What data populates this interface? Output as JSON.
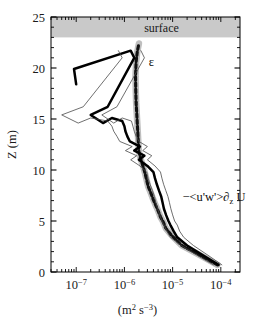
{
  "chart_data": {
    "type": "line",
    "title": "",
    "xlabel": "(m² s⁻³)",
    "ylabel": "Z (m)",
    "xscale": "log",
    "yscale": "linear",
    "xlim": [
      3e-08,
      0.00025
    ],
    "ylim": [
      0,
      25
    ],
    "grid": false,
    "legend_position": "inline-annotations",
    "xticks": [
      1e-07,
      1e-06,
      1e-05,
      0.0001
    ],
    "xtick_labels": [
      "10⁻⁷",
      "10⁻⁶",
      "10⁻⁵",
      "10⁻⁴"
    ],
    "yticks": [
      0,
      5,
      10,
      15,
      20,
      25
    ],
    "ytick_labels": [
      "0",
      "5",
      "10",
      "15",
      "20",
      "25"
    ],
    "yminor_ticks": [
      1,
      2,
      3,
      4,
      6,
      7,
      8,
      9,
      11,
      12,
      13,
      14,
      16,
      17,
      18,
      19,
      21,
      22,
      23,
      24
    ],
    "shaded_regions": [
      {
        "name": "surface",
        "label": "surface",
        "y_from": 23.0,
        "y_to": 25.0,
        "color": "#c9c9c9"
      }
    ],
    "annotations": [
      {
        "name": "epsilon-label",
        "text": "ε",
        "x": 3.2e-06,
        "y": 20.2
      },
      {
        "name": "stress-production-label",
        "text": "−<u'w'>∂",
        "sub": "z",
        "text_tail": " U",
        "x": 1.6e-05,
        "y": 7.0
      }
    ],
    "series": [
      {
        "name": "epsilon",
        "label": "ε",
        "style": "dashed",
        "color": "#111111",
        "band_color": "#bfbfbf",
        "x": [
          8.5e-05,
          4.2e-05,
          1.55e-05,
          9.5e-06,
          7.2e-06,
          6.4e-06,
          5.6e-06,
          5e-06,
          4.4e-06,
          3.9e-06,
          3.5e-06,
          3.1e-06,
          2.9e-06,
          2.7e-06,
          2.5e-06,
          2.2e-06,
          2e-06,
          1.95e-06,
          1.9e-06,
          1.85e-06,
          1.8e-06,
          1.75e-06,
          1.72e-06,
          1.7e-06,
          1.75e-06,
          1.85e-06,
          2e-06
        ],
        "y": [
          0.7,
          1.5,
          2.6,
          3.6,
          4.3,
          4.9,
          5.4,
          6.0,
          6.6,
          7.2,
          7.8,
          8.4,
          9.0,
          9.6,
          10.2,
          11.0,
          11.8,
          12.6,
          13.6,
          14.6,
          15.6,
          16.6,
          17.8,
          19.2,
          20.6,
          21.6,
          22.4
        ]
      },
      {
        "name": "stress-production",
        "label": "−<u'w'>∂_z U",
        "style": "solid",
        "color": "#000000",
        "x": [
          9e-05,
          4.8e-05,
          2e-05,
          1.25e-05,
          1.05e-05,
          9e-06,
          8.2e-06,
          7.3e-06,
          6.6e-06,
          6.2e-06,
          5.8e-06,
          5.2e-06,
          4.7e-06,
          4.3e-06,
          4e-06,
          3e-06,
          2e-06,
          2.6e-06,
          1.6e-06,
          2.1e-06,
          1.3e-06,
          1.15e-06,
          1.05e-06,
          1e-06,
          9e-07,
          5.5e-07,
          3.6e-07,
          2e-07,
          4.5e-07,
          1.6e-06,
          1.35e-06,
          9e-08,
          1e-07
        ],
        "y": [
          0.7,
          1.5,
          2.6,
          3.4,
          4.0,
          4.6,
          5.0,
          5.6,
          6.2,
          6.8,
          7.4,
          8.0,
          8.6,
          9.2,
          9.8,
          10.4,
          11.0,
          11.4,
          11.9,
          12.3,
          12.8,
          13.3,
          13.8,
          14.3,
          14.8,
          15.1,
          14.6,
          15.4,
          16.2,
          21.0,
          21.7,
          19.9,
          18.4
        ]
      },
      {
        "name": "stress-production-upper-bound",
        "label": "upper confidence bound",
        "style": "thin",
        "color": "#4a4a4a",
        "x": [
          0.000105,
          6e-05,
          2.7e-05,
          1.7e-05,
          1.4e-05,
          1.25e-05,
          1.1e-05,
          1e-05,
          9.2e-06,
          8.6e-06,
          8e-06,
          7.2e-06,
          6.5e-06,
          6e-06,
          5.6e-06,
          4.3e-06,
          3e-06,
          3.7e-06,
          2.4e-06,
          3e-06,
          2e-06,
          1.75e-06,
          1.6e-06,
          1.5e-06,
          1.4e-06,
          9e-07,
          6e-07,
          3.4e-07,
          7e-07,
          2.6e-06,
          2.2e-06
        ],
        "y": [
          0.7,
          1.5,
          2.6,
          3.4,
          4.0,
          4.6,
          5.0,
          5.6,
          6.2,
          6.8,
          7.4,
          8.0,
          8.6,
          9.2,
          9.8,
          10.4,
          11.0,
          11.4,
          11.9,
          12.3,
          12.8,
          13.3,
          13.8,
          14.3,
          14.8,
          15.1,
          14.6,
          15.4,
          16.2,
          21.0,
          21.7
        ]
      },
      {
        "name": "stress-production-lower-bound",
        "label": "lower confidence bound",
        "style": "thin",
        "color": "#4a4a4a",
        "x": [
          7e-05,
          3.6e-05,
          1.5e-05,
          9e-06,
          7.6e-06,
          6.6e-06,
          6e-06,
          5.4e-06,
          4.9e-06,
          4.5e-06,
          4.2e-06,
          3.8e-06,
          3.4e-06,
          3.1e-06,
          2.9e-06,
          2.1e-06,
          1.35e-06,
          1.8e-06,
          1.05e-06,
          1.45e-06,
          8e-07,
          7e-07,
          6e-07,
          5.5e-07,
          4.5e-07,
          2e-07,
          1.1e-07,
          5e-08,
          1.4e-07,
          9e-07,
          7.5e-07
        ],
        "y": [
          0.7,
          1.5,
          2.6,
          3.4,
          4.0,
          4.6,
          5.0,
          5.6,
          6.2,
          6.8,
          7.4,
          8.0,
          8.6,
          9.2,
          9.8,
          10.4,
          11.0,
          11.4,
          11.9,
          12.3,
          12.8,
          13.3,
          13.8,
          14.3,
          14.8,
          15.1,
          14.6,
          15.4,
          16.2,
          21.0,
          21.7
        ]
      }
    ]
  }
}
